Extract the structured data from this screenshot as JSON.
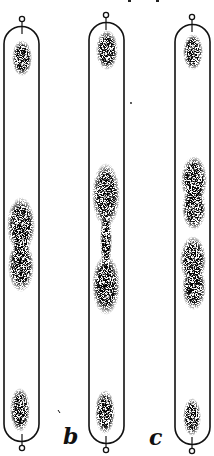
{
  "figure": {
    "ink_color": "#111111",
    "background": "#ffffff",
    "labels": [
      {
        "id": "b",
        "text": "b"
      },
      {
        "id": "c",
        "text": "c"
      }
    ],
    "tubes": [
      {
        "id": "tube-1",
        "blobs": [
          "top-cap",
          "middle-constricted",
          "bottom-cap"
        ]
      },
      {
        "id": "tube-2",
        "blobs": [
          "top-cap",
          "middle-hourglass",
          "bottom-cap"
        ]
      },
      {
        "id": "tube-3",
        "blobs": [
          "top-cap",
          "upper-middle",
          "lower-middle",
          "bottom-cap"
        ]
      }
    ]
  }
}
